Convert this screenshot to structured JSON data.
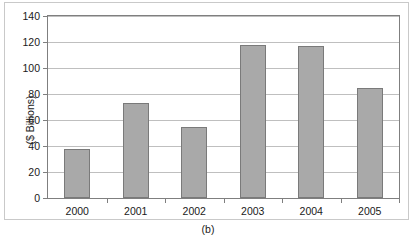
{
  "chart_data": {
    "type": "bar",
    "title": "",
    "subtitle": "",
    "caption": "(b)",
    "xlabel": "",
    "ylabel": "($ Billions)",
    "categories": [
      "2000",
      "2001",
      "2002",
      "2003",
      "2004",
      "2005"
    ],
    "values": [
      38,
      73,
      55,
      118,
      117,
      85
    ],
    "ylim": [
      0,
      140
    ],
    "ytick_labels": [
      "0",
      "20",
      "40",
      "60",
      "80",
      "100",
      "120",
      "140"
    ],
    "ytick_values": [
      0,
      20,
      40,
      60,
      80,
      100,
      120,
      140
    ],
    "grid": true,
    "legend": "none",
    "series": [
      {
        "name": "value",
        "values": [
          38,
          73,
          55,
          118,
          117,
          85
        ]
      }
    ],
    "colors": {
      "bar_fill": "#a9a9a9",
      "bar_border": "#7a7a7a",
      "gridline": "#bfbfbf",
      "axis": "#7f7f7f",
      "text": "#1a1a1a",
      "background": "#ffffff",
      "outer_frame": "#c9c9c9"
    }
  }
}
